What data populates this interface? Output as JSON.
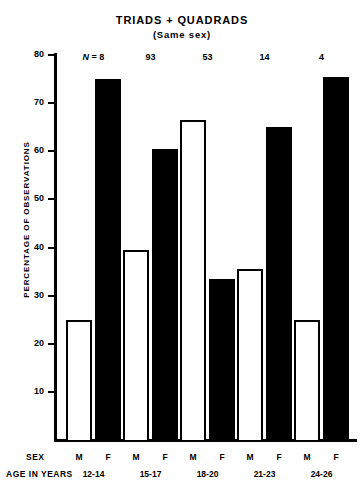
{
  "chart_data": {
    "type": "bar",
    "title": "TRIADS + QUADRADS",
    "subtitle": "(Same sex)",
    "xlabel": "AGE IN YEARS",
    "ylabel": "PERCENTAGE OF OBSERVATIONS",
    "ylim": [
      0,
      80
    ],
    "yticks": [
      10,
      20,
      30,
      40,
      50,
      60,
      70,
      80
    ],
    "ytick_labels": [
      "10",
      "20",
      "30",
      "40",
      "50",
      "60",
      "70",
      "80"
    ],
    "grid": false,
    "legend": "none",
    "categories": [
      "12-14",
      "15-17",
      "18-20",
      "21-23",
      "24-26"
    ],
    "group_counts": [
      "N = 8",
      "93",
      "53",
      "14",
      "4"
    ],
    "group_counts_values": [
      8,
      93,
      53,
      14,
      4
    ],
    "sex_labels": [
      "M",
      "F"
    ],
    "series": [
      {
        "name": "M",
        "fill": "white",
        "values": [
          25,
          39.5,
          66.5,
          35.5,
          25
        ]
      },
      {
        "name": "F",
        "fill": "black",
        "values": [
          75,
          60.5,
          33.5,
          65,
          75.5
        ]
      }
    ],
    "row_header_sex": "SEX",
    "row_header_age": "AGE IN YEARS",
    "colors": {
      "bar_female": "#000000",
      "bar_male": "#ffffff",
      "axis": "#000000"
    }
  }
}
